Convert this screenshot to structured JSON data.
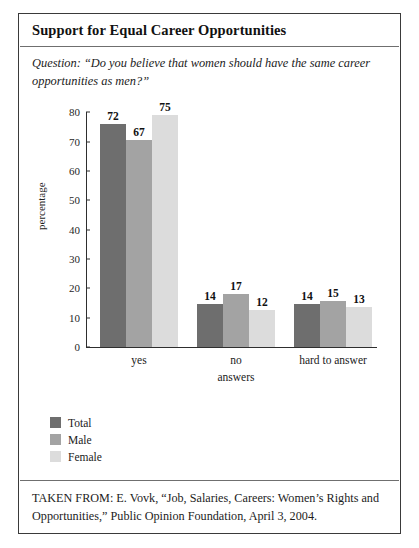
{
  "figure": {
    "title": "Support for Equal Career Opportunities",
    "question": "Question: “Do you believe that women should have the same career opportunities as men?”",
    "source": "TAKEN FROM: E. Vovk, “Job, Salaries, Careers: Women’s Rights and Opportunities,” Public Opinion Foundation, April 3, 2004."
  },
  "chart_data": {
    "type": "bar",
    "title": "Support for Equal Career Opportunities",
    "xlabel": "answers",
    "ylabel": "percentage",
    "ylim": [
      0,
      80
    ],
    "yticks": [
      0,
      10,
      20,
      30,
      40,
      50,
      60,
      70,
      80
    ],
    "grid": false,
    "legend_position": "below-left",
    "categories": [
      "yes",
      "no",
      "hard to answer"
    ],
    "series": [
      {
        "name": "Total",
        "color": "#6e6e6e",
        "values": [
          72,
          14,
          14
        ]
      },
      {
        "name": "Male",
        "color": "#a3a3a3",
        "values": [
          67,
          17,
          15
        ]
      },
      {
        "name": "Female",
        "color": "#dcdcdc",
        "values": [
          75,
          12,
          13
        ]
      }
    ]
  }
}
